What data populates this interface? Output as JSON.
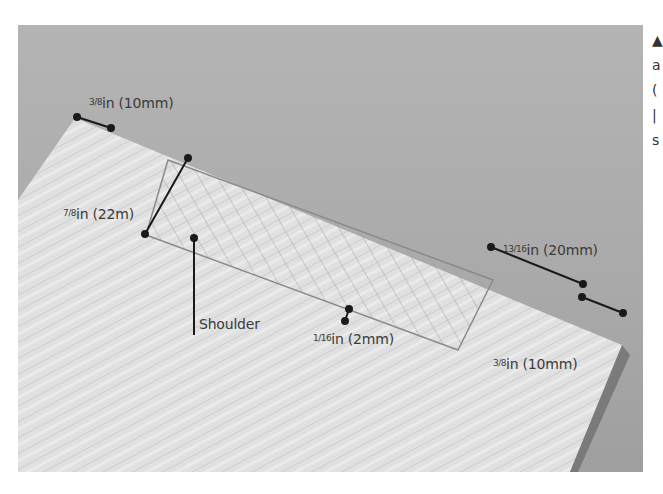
{
  "photo": {
    "subject": "wooden board with marked tenon",
    "background_color": "#aaaaaa",
    "wood_color": "#e2e2e2",
    "annotation_color": "#1a1a1a"
  },
  "annotations": [
    {
      "id": "top-left-width",
      "frac": "3/8",
      "text": "in (10mm)"
    },
    {
      "id": "tenon-width",
      "frac": "7/8",
      "text": "in (22m)"
    },
    {
      "id": "tenon-length",
      "frac": "13/16",
      "text": "in (20mm)"
    },
    {
      "id": "shoulder-depth",
      "frac": "1/16",
      "text": "in (2mm)"
    },
    {
      "id": "right-width",
      "frac": "3/8",
      "text": "in (10mm)"
    },
    {
      "id": "shoulder",
      "frac": "",
      "text": "Shoulder"
    }
  ],
  "side_text": [
    "▲",
    "a",
    "(",
    "|",
    "s"
  ]
}
